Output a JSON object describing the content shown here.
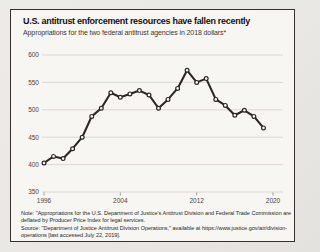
{
  "chart_data": {
    "type": "line",
    "title": "U.S. antitrust enforcement resources have fallen recently",
    "subtitle": "Appropriations for the two federal antitrust agencies in 2018 dollars*",
    "x": [
      1996,
      1997,
      1998,
      1999,
      2000,
      2001,
      2002,
      2003,
      2004,
      2005,
      2006,
      2007,
      2008,
      2009,
      2010,
      2011,
      2012,
      2013,
      2014,
      2015,
      2016,
      2017,
      2018,
      2019
    ],
    "series": [
      {
        "name": "Combined DOJ Antitrust Division and FTC appropriations (2018 dollars)",
        "values": [
          403,
          415,
          411,
          429,
          450,
          488,
          503,
          531,
          523,
          529,
          535,
          527,
          503,
          519,
          539,
          572,
          550,
          557,
          519,
          508,
          490,
          499,
          488,
          467
        ]
      }
    ],
    "xlabel": "",
    "ylabel": "",
    "ylim": [
      350,
      600
    ],
    "yticks": [
      350,
      400,
      450,
      500,
      550,
      600
    ],
    "xticks": [
      1996,
      2004,
      2012,
      2020
    ],
    "grid": "horizontal",
    "legend": "none",
    "line_color": "#2b2823",
    "marker": "open-circle",
    "note": "Note: \"Appropriations for the U.S. Department of Justice's Antitrust Division and Federal Trade Commission are deflated by Producer Price Index for legal services.",
    "source": "Source: \"Department of Justice Antitrust Division Operations,\" available at https://www.justice.gov/atr/division-operations [last accessed July 22, 2019]."
  },
  "colors": {
    "page_background": "#e9e8e4",
    "card_background": "#f8f6f3",
    "card_border": "#35322d",
    "gridline": "#cfccc6",
    "axis_text": "#494540",
    "line": "#2b2823",
    "marker_fill": "#f8f6f3"
  }
}
